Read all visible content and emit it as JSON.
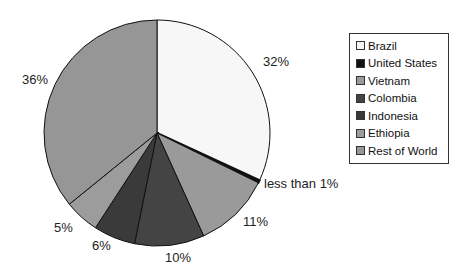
{
  "chart_data": {
    "type": "pie",
    "title": "",
    "start_angle": "top",
    "direction": "clockwise",
    "slices": [
      {
        "label": "Brazil",
        "value": 32,
        "display": "32%",
        "color": "#f7f7f7"
      },
      {
        "label": "United States",
        "value": 0.4,
        "display": "less than 1%",
        "color": "#111111"
      },
      {
        "label": "Vietnam",
        "value": 11,
        "display": "11%",
        "color": "#9a9a9a"
      },
      {
        "label": "Colombia",
        "value": 10,
        "display": "10%",
        "color": "#444444"
      },
      {
        "label": "Indonesia",
        "value": 6,
        "display": "6%",
        "color": "#3a3a3a"
      },
      {
        "label": "Ethiopia",
        "value": 5,
        "display": "5%",
        "color": "#9c9c9c"
      },
      {
        "label": "Rest of World",
        "value": 36,
        "display": "36%",
        "color": "#969696"
      }
    ],
    "legend": {
      "position": "right",
      "entries": [
        "Brazil",
        "United States",
        "Vietnam",
        "Colombia",
        "Indonesia",
        "Ethiopia",
        "Rest of World"
      ]
    }
  }
}
